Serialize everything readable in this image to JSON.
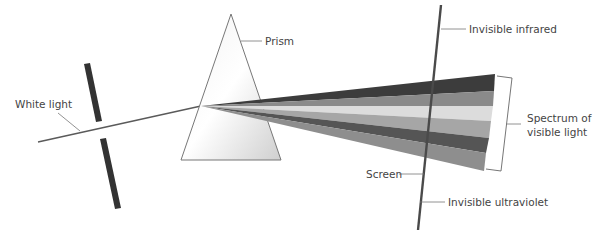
{
  "diagram": {
    "labels": {
      "white_light": "White light",
      "prism": "Prism",
      "invisible_infrared": "Invisible infrared",
      "spectrum_line1": "Spectrum of",
      "spectrum_line2": "visible light",
      "screen": "Screen",
      "invisible_ultraviolet": "Invisible ultraviolet"
    },
    "spectrum_bands": [
      {
        "name": "band-1",
        "color": "#3c3c3c"
      },
      {
        "name": "band-2",
        "color": "#8a8a8a"
      },
      {
        "name": "band-3",
        "color": "#dcdcdc"
      },
      {
        "name": "band-4",
        "color": "#a6a6a6"
      },
      {
        "name": "band-5",
        "color": "#555555"
      },
      {
        "name": "band-6",
        "color": "#8e8e8e"
      }
    ],
    "colors": {
      "line": "#5a5a5a",
      "slit": "#333333",
      "screen": "#4a4a4a",
      "prism_fill": "#e4e4e4",
      "prism_stroke": "#777777"
    }
  }
}
